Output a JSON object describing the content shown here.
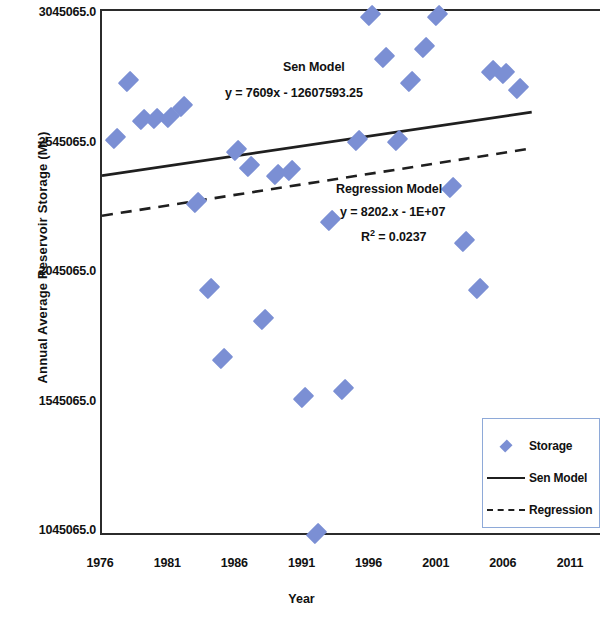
{
  "chart_data": {
    "type": "scatter",
    "title": "",
    "xlabel": "Year",
    "ylabel": "Annual Average Reservoir Storage (ML)",
    "xlim": [
      1976,
      2011
    ],
    "ylim": [
      1045065.0,
      3045065.0
    ],
    "grid": false,
    "legend_position": "bottom-right",
    "x_ticks": [
      "1976",
      "1981",
      "1986",
      "1991",
      "1996",
      "2001",
      "2006",
      "2011"
    ],
    "y_ticks": [
      "1045065.0",
      "1545065.0",
      "2045065.0",
      "2545065.0",
      "3045065.0"
    ],
    "marker_color": "#7b8fd4",
    "line_color": "#1f1f1f",
    "series": [
      {
        "name": "Storage",
        "type": "scatter",
        "points": [
          {
            "x": 1977,
            "y": 2570000
          },
          {
            "x": 1978,
            "y": 2790000
          },
          {
            "x": 1979,
            "y": 2640000
          },
          {
            "x": 1980,
            "y": 2645000
          },
          {
            "x": 1981,
            "y": 2650000
          },
          {
            "x": 1982,
            "y": 2690000
          },
          {
            "x": 1983,
            "y": 2320000
          },
          {
            "x": 1984,
            "y": 1990000
          },
          {
            "x": 1985,
            "y": 1720000
          },
          {
            "x": 1986,
            "y": 2520000
          },
          {
            "x": 1987,
            "y": 2460000
          },
          {
            "x": 1988,
            "y": 1870000
          },
          {
            "x": 1989,
            "y": 2430000
          },
          {
            "x": 1990,
            "y": 2445000
          },
          {
            "x": 1991,
            "y": 1570000
          },
          {
            "x": 1992,
            "y": 1045065
          },
          {
            "x": 1993,
            "y": 2250000
          },
          {
            "x": 1994,
            "y": 1600000
          },
          {
            "x": 1995,
            "y": 2560000
          },
          {
            "x": 1996,
            "y": 3045065
          },
          {
            "x": 1997,
            "y": 2880000
          },
          {
            "x": 1998,
            "y": 2560000
          },
          {
            "x": 1999,
            "y": 2790000
          },
          {
            "x": 2000,
            "y": 2920000
          },
          {
            "x": 2001,
            "y": 3045065
          },
          {
            "x": 2002,
            "y": 2380000
          },
          {
            "x": 2003,
            "y": 2170000
          },
          {
            "x": 2004,
            "y": 1990000
          },
          {
            "x": 2005,
            "y": 2830000
          },
          {
            "x": 2006,
            "y": 2820000
          },
          {
            "x": 2007,
            "y": 2760000
          }
        ]
      },
      {
        "name": "Sen Model",
        "type": "line",
        "style": "solid",
        "equation": "y = 7609x - 12607593.25",
        "slope": 7609,
        "intercept": -12607593.25,
        "endpoints": [
          {
            "x": 1976,
            "y": 2425000
          },
          {
            "x": 2008,
            "y": 2670000
          }
        ]
      },
      {
        "name": "Regression",
        "type": "line",
        "style": "dashed",
        "equation": "y = 8202.x - 1E+07",
        "r_squared": 0.0237,
        "slope": 8202,
        "intercept": -10000000,
        "endpoints": [
          {
            "x": 1976,
            "y": 2270000
          },
          {
            "x": 2008,
            "y": 2530000
          }
        ]
      }
    ],
    "annotations": [
      {
        "id": "sen_title",
        "text": "Sen Model"
      },
      {
        "id": "sen_equation",
        "text": "y = 7609x - 12607593.25"
      },
      {
        "id": "regression_title",
        "text": "Regression  Model"
      },
      {
        "id": "regression_equation",
        "text": "y = 8202.x - 1E+07"
      },
      {
        "id": "regression_r2_prefix",
        "text": "R"
      },
      {
        "id": "regression_r2_sup",
        "text": "2"
      },
      {
        "id": "regression_r2_value",
        "text": " = 0.0237"
      }
    ],
    "legend": [
      {
        "label": "Storage",
        "key": "diamond-marker"
      },
      {
        "label": "Sen Model",
        "key": "solid-line"
      },
      {
        "label": "Regression",
        "key": "dashed-line"
      }
    ]
  }
}
